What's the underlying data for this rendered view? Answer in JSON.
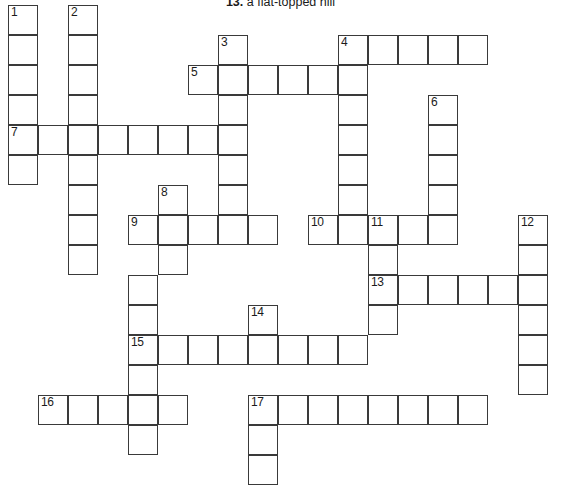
{
  "clue": {
    "number": "13.",
    "text": "a flat-topped hill"
  },
  "grid": {
    "origin_x": 8,
    "origin_y": 5,
    "cell_size": 30,
    "cells": [
      {
        "c": 0,
        "r": 0,
        "n": "1"
      },
      {
        "c": 0,
        "r": 1
      },
      {
        "c": 0,
        "r": 2
      },
      {
        "c": 0,
        "r": 3
      },
      {
        "c": 0,
        "r": 4,
        "n": "7"
      },
      {
        "c": 0,
        "r": 5
      },
      {
        "c": 2,
        "r": 0,
        "n": "2"
      },
      {
        "c": 2,
        "r": 1
      },
      {
        "c": 2,
        "r": 2
      },
      {
        "c": 2,
        "r": 3
      },
      {
        "c": 2,
        "r": 4
      },
      {
        "c": 2,
        "r": 5
      },
      {
        "c": 2,
        "r": 6
      },
      {
        "c": 2,
        "r": 7
      },
      {
        "c": 2,
        "r": 8
      },
      {
        "c": 1,
        "r": 4
      },
      {
        "c": 3,
        "r": 4
      },
      {
        "c": 4,
        "r": 4
      },
      {
        "c": 5,
        "r": 4
      },
      {
        "c": 6,
        "r": 4
      },
      {
        "c": 7,
        "r": 1,
        "n": "3"
      },
      {
        "c": 7,
        "r": 2
      },
      {
        "c": 7,
        "r": 3
      },
      {
        "c": 7,
        "r": 4
      },
      {
        "c": 7,
        "r": 5
      },
      {
        "c": 7,
        "r": 6
      },
      {
        "c": 7,
        "r": 7
      },
      {
        "c": 6,
        "r": 2,
        "n": "5"
      },
      {
        "c": 8,
        "r": 2
      },
      {
        "c": 9,
        "r": 2
      },
      {
        "c": 10,
        "r": 2
      },
      {
        "c": 11,
        "r": 1,
        "n": "4"
      },
      {
        "c": 12,
        "r": 1
      },
      {
        "c": 13,
        "r": 1
      },
      {
        "c": 14,
        "r": 1
      },
      {
        "c": 15,
        "r": 1
      },
      {
        "c": 11,
        "r": 2
      },
      {
        "c": 11,
        "r": 3
      },
      {
        "c": 11,
        "r": 4
      },
      {
        "c": 11,
        "r": 5
      },
      {
        "c": 11,
        "r": 6
      },
      {
        "c": 11,
        "r": 7
      },
      {
        "c": 14,
        "r": 3,
        "n": "6"
      },
      {
        "c": 14,
        "r": 4
      },
      {
        "c": 14,
        "r": 5
      },
      {
        "c": 14,
        "r": 6
      },
      {
        "c": 14,
        "r": 7
      },
      {
        "c": 5,
        "r": 6,
        "n": "8"
      },
      {
        "c": 5,
        "r": 7
      },
      {
        "c": 5,
        "r": 8
      },
      {
        "c": 4,
        "r": 7,
        "n": "9"
      },
      {
        "c": 6,
        "r": 7
      },
      {
        "c": 7,
        "r": 7
      },
      {
        "c": 8,
        "r": 7
      },
      {
        "c": 10,
        "r": 7,
        "n": "10"
      },
      {
        "c": 12,
        "r": 7,
        "n": "11"
      },
      {
        "c": 13,
        "r": 7
      },
      {
        "c": 17,
        "r": 7,
        "n": "12"
      },
      {
        "c": 17,
        "r": 8
      },
      {
        "c": 17,
        "r": 9
      },
      {
        "c": 17,
        "r": 10
      },
      {
        "c": 17,
        "r": 11
      },
      {
        "c": 17,
        "r": 12
      },
      {
        "c": 12,
        "r": 8
      },
      {
        "c": 12,
        "r": 9,
        "n": "13"
      },
      {
        "c": 13,
        "r": 9
      },
      {
        "c": 14,
        "r": 9
      },
      {
        "c": 15,
        "r": 9
      },
      {
        "c": 16,
        "r": 9
      },
      {
        "c": 12,
        "r": 10
      },
      {
        "c": 4,
        "r": 9
      },
      {
        "c": 4,
        "r": 10
      },
      {
        "c": 8,
        "r": 10,
        "n": "14"
      },
      {
        "c": 4,
        "r": 11,
        "n": "15"
      },
      {
        "c": 5,
        "r": 11
      },
      {
        "c": 6,
        "r": 11
      },
      {
        "c": 7,
        "r": 11
      },
      {
        "c": 8,
        "r": 11
      },
      {
        "c": 9,
        "r": 11
      },
      {
        "c": 10,
        "r": 11
      },
      {
        "c": 11,
        "r": 11
      },
      {
        "c": 4,
        "r": 12
      },
      {
        "c": 1,
        "r": 13,
        "n": "16"
      },
      {
        "c": 2,
        "r": 13
      },
      {
        "c": 3,
        "r": 13
      },
      {
        "c": 4,
        "r": 13
      },
      {
        "c": 5,
        "r": 13
      },
      {
        "c": 4,
        "r": 14
      },
      {
        "c": 8,
        "r": 13,
        "n": "17"
      },
      {
        "c": 9,
        "r": 13
      },
      {
        "c": 10,
        "r": 13
      },
      {
        "c": 11,
        "r": 13
      },
      {
        "c": 12,
        "r": 13
      },
      {
        "c": 13,
        "r": 13
      },
      {
        "c": 14,
        "r": 13
      },
      {
        "c": 15,
        "r": 13
      },
      {
        "c": 8,
        "r": 14
      },
      {
        "c": 8,
        "r": 15
      }
    ]
  },
  "colors": {
    "cell_border": "#3a3a3a",
    "cell_fill": "#ffffff",
    "number_text": "#1b1b1b",
    "page_background": "#ffffff"
  }
}
